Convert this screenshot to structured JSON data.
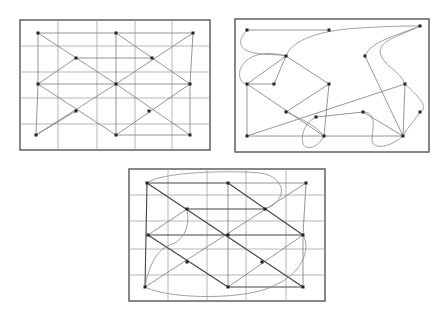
{
  "figure": {
    "panels": [
      {
        "id": "top-left",
        "frame": {
          "x": 20,
          "y": 20,
          "w": 190,
          "h": 130
        },
        "grid": {
          "verticals": [
            58,
            97,
            135,
            172
          ],
          "horizontals": [
            46,
            72,
            98,
            124
          ]
        },
        "nodes": [
          [
            38,
            33
          ],
          [
            116,
            33
          ],
          [
            193,
            33
          ],
          [
            76,
            58
          ],
          [
            152,
            58
          ],
          [
            38,
            84
          ],
          [
            116,
            84
          ],
          [
            190,
            84
          ],
          [
            76,
            111
          ],
          [
            149,
            111
          ],
          [
            36,
            135
          ],
          [
            116,
            135
          ],
          [
            190,
            135
          ]
        ],
        "edges": [
          [
            [
              38,
              33
            ],
            [
              116,
              33
            ]
          ],
          [
            [
              116,
              33
            ],
            [
              193,
              33
            ]
          ],
          [
            [
              38,
              33
            ],
            [
              116,
              84
            ]
          ],
          [
            [
              116,
              84
            ],
            [
              190,
              135
            ]
          ],
          [
            [
              116,
              33
            ],
            [
              190,
              84
            ]
          ],
          [
            [
              193,
              33
            ],
            [
              116,
              84
            ]
          ],
          [
            [
              116,
              84
            ],
            [
              36,
              135
            ]
          ],
          [
            [
              193,
              33
            ],
            [
              190,
              84
            ]
          ],
          [
            [
              76,
              58
            ],
            [
              152,
              58
            ]
          ],
          [
            [
              76,
              58
            ],
            [
              38,
              84
            ]
          ],
          [
            [
              38,
              84
            ],
            [
              116,
              135
            ]
          ],
          [
            [
              38,
              84
            ],
            [
              190,
              84
            ]
          ],
          [
            [
              116,
              33
            ],
            [
              116,
              135
            ]
          ],
          [
            [
              190,
              84
            ],
            [
              116,
              135
            ]
          ],
          [
            [
              36,
              135
            ],
            [
              38,
              84
            ]
          ],
          [
            [
              38,
              33
            ],
            [
              38,
              84
            ]
          ],
          [
            [
              116,
              135
            ],
            [
              190,
              135
            ]
          ],
          [
            [
              36,
              135
            ],
            [
              76,
              111
            ]
          ],
          [
            [
              190,
              84
            ],
            [
              190,
              135
            ]
          ]
        ]
      },
      {
        "id": "top-right",
        "frame": {
          "x": 235,
          "y": 19,
          "w": 194,
          "h": 133
        },
        "nodes": [
          [
            247,
            30
          ],
          [
            329,
            30
          ],
          [
            420,
            26
          ],
          [
            286,
            56
          ],
          [
            365,
            56
          ],
          [
            247,
            84
          ],
          [
            274,
            84
          ],
          [
            329,
            84
          ],
          [
            405,
            84
          ],
          [
            286,
            112
          ],
          [
            316,
            117
          ],
          [
            363,
            112
          ],
          [
            420,
            112
          ],
          [
            247,
            136
          ],
          [
            324,
            136
          ],
          [
            403,
            136
          ]
        ],
        "edges": [
          [
            [
              247,
              30
            ],
            [
              329,
              30
            ]
          ],
          [
            [
              286,
              56
            ],
            [
              247,
              84
            ]
          ],
          [
            [
              286,
              56
            ],
            [
              274,
              84
            ]
          ],
          [
            [
              286,
              56
            ],
            [
              329,
              84
            ]
          ],
          [
            [
              247,
              84
            ],
            [
              274,
              84
            ]
          ],
          [
            [
              247,
              84
            ],
            [
              247,
              136
            ]
          ],
          [
            [
              247,
              84
            ],
            [
              324,
              136
            ]
          ],
          [
            [
              329,
              84
            ],
            [
              286,
              112
            ]
          ],
          [
            [
              329,
              84
            ],
            [
              324,
              136
            ]
          ],
          [
            [
              247,
              136
            ],
            [
              403,
              136
            ]
          ],
          [
            [
              247,
              136
            ],
            [
              405,
              84
            ]
          ],
          [
            [
              365,
              56
            ],
            [
              403,
              136
            ]
          ],
          [
            [
              405,
              84
            ],
            [
              403,
              136
            ]
          ],
          [
            [
              363,
              112
            ],
            [
              403,
              136
            ]
          ],
          [
            [
              316,
              117
            ],
            [
              363,
              112
            ]
          ]
        ],
        "curves": [
          "M247,30 C236,42 238,52 262,54 C276,55 284,55 286,56",
          "M286,56 C292,40 320,30 360,28 C390,26 410,26 420,26",
          "M420,26 C395,36 370,42 365,56",
          "M286,56 C265,50 245,55 240,70 C238,80 243,84 247,84",
          "M420,26 C400,36 380,40 380,52 C382,66 400,70 405,84",
          "M405,84 C418,96 430,108 420,112",
          "M420,112 C412,124 404,132 403,136",
          "M316,117 C300,125 300,145 306,147 C315,150 322,140 324,136",
          "M363,112 C378,112 372,130 372,140 C372,150 390,148 403,136",
          "M286,112 C300,118 315,125 324,136"
        ]
      },
      {
        "id": "bottom",
        "frame": {
          "x": 129,
          "y": 169,
          "w": 196,
          "h": 132
        },
        "grid": {
          "verticals": [
            168,
            207,
            246,
            286
          ],
          "horizontals": [
            195,
            221,
            249,
            275
          ]
        },
        "nodes": [
          [
            147,
            183
          ],
          [
            228,
            183
          ],
          [
            306,
            183
          ],
          [
            187,
            209
          ],
          [
            265,
            209
          ],
          [
            148,
            235
          ],
          [
            228,
            235
          ],
          [
            303,
            235
          ],
          [
            187,
            262
          ],
          [
            262,
            262
          ],
          [
            145,
            287
          ],
          [
            228,
            287
          ],
          [
            303,
            287
          ]
        ],
        "dark_edges": [
          [
            [
              147,
              183
            ],
            [
              228,
              183
            ]
          ],
          [
            [
              147,
              183
            ],
            [
              303,
              287
            ]
          ],
          [
            [
              228,
              183
            ],
            [
              303,
              235
            ]
          ],
          [
            [
              148,
              235
            ],
            [
              228,
              287
            ]
          ],
          [
            [
              148,
              235
            ],
            [
              303,
              235
            ]
          ],
          [
            [
              147,
              183
            ],
            [
              145,
              287
            ]
          ],
          [
            [
              228,
              287
            ],
            [
              303,
              287
            ]
          ],
          [
            [
              187,
              209
            ],
            [
              265,
              209
            ]
          ]
        ],
        "edges": [
          [
            [
              306,
              183
            ],
            [
              145,
              287
            ]
          ],
          [
            [
              187,
              209
            ],
            [
              148,
              235
            ]
          ],
          [
            [
              303,
              235
            ],
            [
              228,
              287
            ]
          ],
          [
            [
              228,
              183
            ],
            [
              306,
              183
            ]
          ],
          [
            [
              306,
              183
            ],
            [
              303,
              235
            ]
          ],
          [
            [
              228,
              183
            ],
            [
              228,
              287
            ]
          ],
          [
            [
              303,
              235
            ],
            [
              303,
              287
            ]
          ]
        ],
        "curves": [
          "M147,183 C160,172 230,170 260,173 C285,176 290,200 265,209",
          "M187,209 C190,225 185,240 170,245 C155,250 148,270 145,287",
          "M303,235 C312,250 300,275 275,285 C250,300 170,300 145,287"
        ]
      }
    ]
  }
}
